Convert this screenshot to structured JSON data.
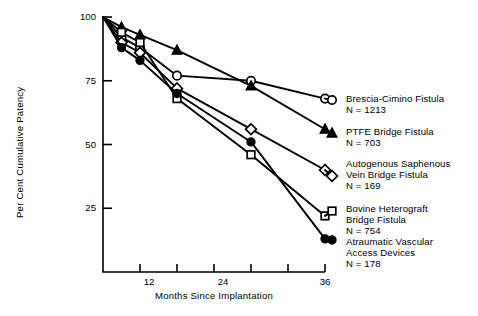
{
  "chart_data": {
    "type": "line",
    "title": "",
    "xlabel": "Months Since Implantation",
    "ylabel": "Per Cent Cumulative Patency",
    "xlim": [
      0,
      36
    ],
    "ylim": [
      0,
      100
    ],
    "x_ticks": [
      0,
      6,
      12,
      18,
      24,
      30,
      36
    ],
    "x_tick_labels": [
      "",
      "",
      "12",
      "",
      "24",
      "",
      "36"
    ],
    "y_ticks": [
      25,
      50,
      75,
      100
    ],
    "y_tick_labels": [
      "25",
      "50",
      "75",
      "100"
    ],
    "grid": false,
    "legend_position": "right",
    "x": [
      0,
      3,
      6,
      12,
      24,
      36
    ],
    "series": [
      {
        "name": "Brescia-Cimino Fistula",
        "n_label": "N = 1213",
        "marker": "open-circle",
        "values": [
          100,
          92,
          88,
          77,
          75,
          68
        ]
      },
      {
        "name": "PTFE Bridge Fistula",
        "n_label": "N = 703",
        "marker": "filled-triangle",
        "values": [
          100,
          96,
          93,
          87,
          73,
          56
        ]
      },
      {
        "name": "Autogenous Saphenous Vein Bridge Fistula",
        "name_line1": "Autogenous Saphenous",
        "name_line2": "Vein Bridge Fistula",
        "n_label": "N = 169",
        "marker": "open-diamond",
        "values": [
          100,
          90,
          86,
          72,
          56,
          40
        ]
      },
      {
        "name": "Bovine Heterograft Bridge Fistula",
        "name_line1": "Bovine Heterograft",
        "name_line2": "Bridge Fistula",
        "n_label": "N = 754",
        "marker": "open-square",
        "values": [
          100,
          94,
          90,
          68,
          46,
          22
        ]
      },
      {
        "name": "Atraumatic Vascular Access Devices",
        "name_line1": "Atraumatic Vascular",
        "name_line2": "Access Devices",
        "n_label": "N = 178",
        "marker": "filled-circle",
        "values": [
          100,
          88,
          83,
          70,
          51,
          13
        ]
      }
    ]
  },
  "axes": {
    "y_label": "Per Cent Cumulative Patency",
    "x_label": "Months Since Implantation",
    "y_tick_100": "100",
    "y_tick_75": "75",
    "y_tick_50": "50",
    "y_tick_25": "25",
    "x_tick_12": "12",
    "x_tick_24": "24",
    "x_tick_36": "36"
  },
  "legend": {
    "items": [
      {
        "l1": "Brescia-Cimino Fistula",
        "l2": "N = 1213",
        "marker": "open-circle"
      },
      {
        "l1": "PTFE Bridge Fistula",
        "l2": "N = 703",
        "marker": "filled-triangle"
      },
      {
        "l1": "Autogenous Saphenous",
        "l2": "Vein Bridge Fistula",
        "l3": "N = 169",
        "marker": "open-diamond"
      },
      {
        "l1": "Bovine Heterograft",
        "l2": "Bridge Fistula",
        "l3": "N = 754",
        "marker": "open-square"
      },
      {
        "l1": "Atraumatic Vascular",
        "l2": "Access Devices",
        "l3": "N = 178",
        "marker": "filled-circle"
      }
    ]
  },
  "colors": {
    "ink": "#000000",
    "background": "#ffffff"
  }
}
